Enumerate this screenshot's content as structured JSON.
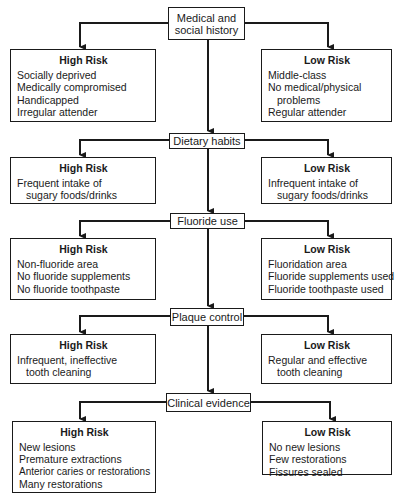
{
  "diagram": {
    "type": "flowchart",
    "stages": [
      {
        "label": "Medical and social history",
        "label_lines": [
          "Medical and",
          "social history"
        ],
        "high_risk": {
          "title": "High Risk",
          "items": [
            "Socially deprived",
            "Medically compromised",
            "Handicapped",
            "Irregular attender"
          ]
        },
        "low_risk": {
          "title": "Low Risk",
          "items": [
            "Middle-class",
            "No medical/physical",
            "problems",
            "Regular attender"
          ]
        }
      },
      {
        "label": "Dietary habits",
        "high_risk": {
          "title": "High Risk",
          "items": [
            "Frequent intake of",
            "sugary foods/drinks"
          ]
        },
        "low_risk": {
          "title": "Low Risk",
          "items": [
            "Infrequent intake of",
            "sugary foods/drinks"
          ]
        }
      },
      {
        "label": "Fluoride use",
        "high_risk": {
          "title": "High Risk",
          "items": [
            "Non-fluoride area",
            "No fluoride supplements",
            "No fluoride toothpaste"
          ]
        },
        "low_risk": {
          "title": "Low Risk",
          "items": [
            "Fluoridation area",
            "Fluoride supplements used",
            "Fluoride toothpaste used"
          ]
        }
      },
      {
        "label": "Plaque control",
        "high_risk": {
          "title": "High Risk",
          "items": [
            "Infrequent, ineffective",
            "tooth cleaning"
          ]
        },
        "low_risk": {
          "title": "Low Risk",
          "items": [
            "Regular and effective",
            "tooth cleaning"
          ]
        }
      },
      {
        "label": "Clinical evidence",
        "high_risk": {
          "title": "High Risk",
          "items": [
            "New lesions",
            "Premature extractions",
            "Anterior caries or restorations",
            "Many restorations"
          ]
        },
        "low_risk": {
          "title": "Low Risk",
          "items": [
            "No new lesions",
            "Few restorations",
            "Fissures sealed"
          ]
        }
      }
    ]
  },
  "colors": {
    "line": "#1a1a1a",
    "background": "#ffffff"
  }
}
